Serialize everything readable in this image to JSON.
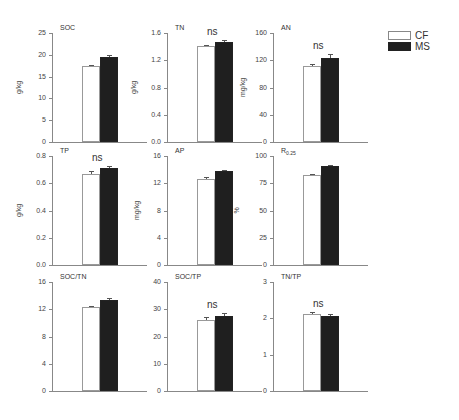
{
  "legend": {
    "items": [
      {
        "label": "CF",
        "color": "#ffffff"
      },
      {
        "label": "MS",
        "color": "#1f1f1f"
      }
    ]
  },
  "chart_data": [
    {
      "type": "bar",
      "title": "SOC",
      "ylabel": "g/kg",
      "categories": [
        "CF",
        "MS"
      ],
      "values": [
        17.4,
        19.6
      ],
      "errors": [
        0.2,
        0.3
      ],
      "ylim": [
        0,
        25
      ],
      "yticks": [
        "0",
        "5",
        "10",
        "15",
        "20",
        "25"
      ],
      "annotation": ""
    },
    {
      "type": "bar",
      "title": "TN",
      "ylabel": "g/kg",
      "categories": [
        "CF",
        "MS"
      ],
      "values": [
        1.41,
        1.47
      ],
      "errors": [
        0.02,
        0.03
      ],
      "ylim": [
        0,
        1.6
      ],
      "yticks": [
        "0.0",
        "0.4",
        "0.8",
        "1.2",
        "1.6"
      ],
      "annotation": "ns"
    },
    {
      "type": "bar",
      "title": "AN",
      "ylabel": "mg/kg",
      "categories": [
        "CF",
        "MS"
      ],
      "values": [
        112,
        123
      ],
      "errors": [
        2,
        6
      ],
      "ylim": [
        0,
        160
      ],
      "yticks": [
        "0",
        "40",
        "80",
        "120",
        "160"
      ],
      "annotation": "ns"
    },
    {
      "type": "bar",
      "title": "TP",
      "ylabel": "g/kg",
      "categories": [
        "CF",
        "MS"
      ],
      "values": [
        0.67,
        0.71
      ],
      "errors": [
        0.02,
        0.02
      ],
      "ylim": [
        0,
        0.8
      ],
      "yticks": [
        "0.0",
        "0.2",
        "0.4",
        "0.6",
        "0.8"
      ],
      "annotation": "ns"
    },
    {
      "type": "bar",
      "title": "AP",
      "ylabel": "mg/kg",
      "categories": [
        "CF",
        "MS"
      ],
      "values": [
        12.6,
        13.8
      ],
      "errors": [
        0.3,
        0.2
      ],
      "ylim": [
        0,
        16
      ],
      "yticks": [
        "0",
        "4",
        "8",
        "12",
        "16"
      ],
      "annotation": ""
    },
    {
      "type": "bar",
      "title": "R",
      "title_sub": "0.25",
      "ylabel": "%",
      "categories": [
        "CF",
        "MS"
      ],
      "values": [
        83,
        91
      ],
      "errors": [
        0.6,
        0.4
      ],
      "ylim": [
        0,
        100
      ],
      "yticks": [
        "0",
        "25",
        "50",
        "75",
        "100"
      ],
      "annotation": ""
    },
    {
      "type": "bar",
      "title": "SOC/TN",
      "ylabel": "",
      "categories": [
        "CF",
        "MS"
      ],
      "values": [
        12.3,
        13.4
      ],
      "errors": [
        0.15,
        0.2
      ],
      "ylim": [
        0,
        16
      ],
      "yticks": [
        "0",
        "4",
        "8",
        "12",
        "16"
      ],
      "annotation": ""
    },
    {
      "type": "bar",
      "title": "SOC/TP",
      "ylabel": "",
      "categories": [
        "CF",
        "MS"
      ],
      "values": [
        26.2,
        27.6
      ],
      "errors": [
        1.0,
        1.1
      ],
      "ylim": [
        0,
        40
      ],
      "yticks": [
        "0",
        "10",
        "20",
        "30",
        "40"
      ],
      "annotation": "ns"
    },
    {
      "type": "bar",
      "title": "TN/TP",
      "ylabel": "",
      "categories": [
        "CF",
        "MS"
      ],
      "values": [
        2.12,
        2.06
      ],
      "errors": [
        0.05,
        0.06
      ],
      "ylim": [
        0,
        3
      ],
      "yticks": [
        "0",
        "1",
        "2",
        "3"
      ],
      "annotation": "ns"
    }
  ]
}
